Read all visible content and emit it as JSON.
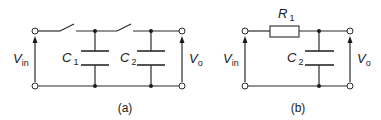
{
  "circuit_a": {
    "caption": "(a)",
    "components": [
      {
        "type": "switch",
        "id": "S1",
        "state": "open"
      },
      {
        "type": "switch",
        "id": "S2",
        "state": "open"
      },
      {
        "type": "capacitor",
        "label": "C",
        "subscript": "1"
      },
      {
        "type": "capacitor",
        "label": "C",
        "subscript": "2"
      }
    ],
    "input_label": {
      "main": "V",
      "subscript": "in"
    },
    "output_label": {
      "main": "V",
      "subscript": "o"
    }
  },
  "circuit_b": {
    "caption": "(b)",
    "components": [
      {
        "type": "resistor",
        "label": "R",
        "subscript": "1"
      },
      {
        "type": "capacitor",
        "label": "C",
        "subscript": "2"
      }
    ],
    "input_label": {
      "main": "V",
      "subscript": "in"
    },
    "output_label": {
      "main": "V",
      "subscript": "o"
    }
  },
  "colors": {
    "ink": "#1a1a1a",
    "background": "#ffffff"
  }
}
